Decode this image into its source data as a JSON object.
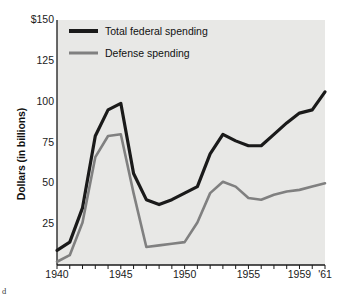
{
  "figure": {
    "corner_mark": "d",
    "plot_background": "#e8e8e6",
    "page_background": "#ffffff"
  },
  "chart_data": {
    "type": "line",
    "title": "",
    "xlabel": "",
    "ylabel": "Dollars (in billions)",
    "xlim": [
      1940,
      1961
    ],
    "ylim": [
      0,
      150
    ],
    "grid": false,
    "legend_position": "top-left",
    "y_ticks": [
      0,
      25,
      50,
      75,
      100,
      125,
      150
    ],
    "y_tick_labels": [
      "",
      "25",
      "50",
      "75",
      "100",
      "125",
      "$150"
    ],
    "x_ticks": [
      1940,
      1945,
      1950,
      1955,
      1959,
      1961
    ],
    "x_tick_labels": [
      "1940",
      "1945",
      "1950",
      "1955",
      "1959",
      "'61"
    ],
    "x_minor_ticks": [
      1940,
      1941,
      1942,
      1943,
      1944,
      1945,
      1946,
      1947,
      1948,
      1949,
      1950,
      1951,
      1952,
      1953,
      1954,
      1955,
      1956,
      1957,
      1958,
      1959,
      1960,
      1961
    ],
    "x": [
      1940,
      1941,
      1942,
      1943,
      1944,
      1945,
      1946,
      1947,
      1948,
      1949,
      1950,
      1951,
      1952,
      1953,
      1954,
      1955,
      1956,
      1957,
      1958,
      1959,
      1960,
      1961
    ],
    "series": [
      {
        "name": "Total federal spending",
        "color": "#1a1a1a",
        "width": 3.2,
        "values": [
          9,
          14,
          35,
          79,
          95,
          99,
          56,
          40,
          37,
          40,
          44,
          48,
          68,
          80,
          76,
          73,
          73,
          80,
          87,
          93,
          95,
          106
        ]
      },
      {
        "name": "Defense spending",
        "color": "#808080",
        "width": 2.6,
        "values": [
          2,
          6,
          26,
          66,
          79,
          80,
          44,
          11,
          12,
          13,
          14,
          26,
          44,
          51,
          48,
          41,
          40,
          43,
          45,
          46,
          48,
          50
        ]
      }
    ]
  },
  "legend": {
    "items": [
      {
        "label": "Total federal spending",
        "color": "#1a1a1a",
        "thickness": 4
      },
      {
        "label": "Defense spending",
        "color": "#808080",
        "thickness": 3
      }
    ]
  }
}
